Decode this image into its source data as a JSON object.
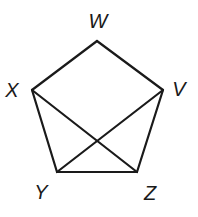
{
  "diagram": {
    "type": "pentagon-with-diagonals",
    "colors": {
      "stroke": "#1a1a1a",
      "background": "#ffffff"
    },
    "vertices": [
      {
        "id": "W",
        "label": "W",
        "x": 97,
        "y": 41,
        "lx": 98,
        "ly": 28
      },
      {
        "id": "V",
        "label": "V",
        "x": 163,
        "y": 90,
        "lx": 179,
        "ly": 96
      },
      {
        "id": "Z",
        "label": "Z",
        "x": 137,
        "y": 172,
        "lx": 150,
        "ly": 200
      },
      {
        "id": "Y",
        "label": "Y",
        "x": 57,
        "y": 172,
        "lx": 41,
        "ly": 199
      },
      {
        "id": "X",
        "label": "X",
        "x": 32,
        "y": 90,
        "lx": 12,
        "ly": 97
      }
    ],
    "edges": [
      {
        "from": "W",
        "to": "V"
      },
      {
        "from": "V",
        "to": "Z"
      },
      {
        "from": "Z",
        "to": "Y"
      },
      {
        "from": "Y",
        "to": "X"
      },
      {
        "from": "X",
        "to": "W"
      },
      {
        "from": "X",
        "to": "Z"
      },
      {
        "from": "V",
        "to": "Y"
      }
    ]
  }
}
